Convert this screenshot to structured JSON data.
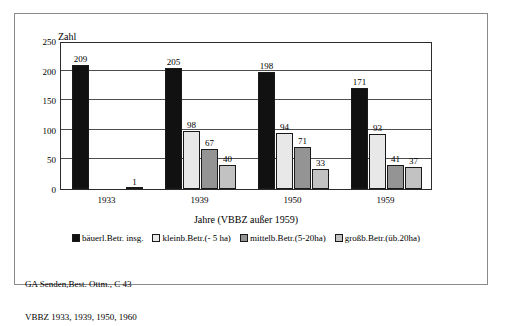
{
  "chart_data": {
    "type": "bar",
    "title": "",
    "xlabel": "Jahre (VBBZ außer 1959)",
    "ylabel": "Zahl",
    "categories": [
      "1933",
      "1939",
      "1950",
      "1959"
    ],
    "ylim": [
      0,
      250
    ],
    "yticks": [
      0,
      50,
      100,
      150,
      200,
      250
    ],
    "ytick_labels": [
      "0",
      "50",
      "100",
      "150",
      "200",
      "250"
    ],
    "grid": true,
    "legend_position": "bottom",
    "series": [
      {
        "name": "bäuerl.Betr. insg.",
        "color": "#111111",
        "values": [
          209,
          205,
          198,
          171
        ],
        "labels": [
          "209",
          "205",
          "198",
          "171"
        ]
      },
      {
        "name": "kleinb.Betr.(- 5 ha)",
        "color": "#e8e8e8",
        "values": [
          null,
          98,
          94,
          93
        ],
        "labels": [
          "",
          "98",
          "94",
          "93"
        ]
      },
      {
        "name": "mittelb.Betr.(5-20ha)",
        "color": "#949494",
        "values": [
          null,
          67,
          71,
          41
        ],
        "labels": [
          "",
          "67",
          "71",
          "41"
        ]
      },
      {
        "name": "großb.Betr.(üb.20ha)",
        "color": "#c2c2c2",
        "values": [
          1,
          40,
          33,
          37
        ],
        "labels": [
          "1",
          "40",
          "33",
          "37"
        ]
      }
    ]
  },
  "axis": {
    "y_title": "Zahl",
    "x_title": "Jahre (VBBZ außer 1959)",
    "y_ticks": [
      "250",
      "200",
      "150",
      "100",
      "50",
      "0"
    ],
    "x_ticks": [
      "1933",
      "1939",
      "1950",
      "1959"
    ]
  },
  "legend": {
    "items": [
      {
        "label": "bäuerl.Betr. insg.",
        "color": "#111111"
      },
      {
        "label": "kleinb.Betr.(- 5 ha)",
        "color": "#e8e8e8"
      },
      {
        "label": "mittelb.Betr.(5-20ha)",
        "color": "#949494"
      },
      {
        "label": "großb.Betr.(üb.20ha)",
        "color": "#c2c2c2"
      }
    ]
  },
  "source": {
    "line1": "GA Senden,Best. Ottm., C 43",
    "line2": "VBBZ 1933, 1939, 1950, 1960"
  }
}
